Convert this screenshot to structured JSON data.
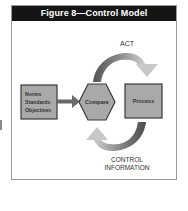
{
  "figure": {
    "title": "Figure 8—Control Model",
    "header_bg": "#151515",
    "header_fg": "#ffffff"
  },
  "nodes": {
    "inputs": {
      "label_lines": [
        "Norms",
        "Standards",
        "Objectives"
      ],
      "line1": "Norms",
      "line2": "Standards",
      "line3": "Objectives",
      "fill": "#a9a9a9"
    },
    "compare": {
      "label": "Compare",
      "shape": "hexagon",
      "fill": "#a9a9a9"
    },
    "process": {
      "label": "Process",
      "shape": "rectangle",
      "fill": "#a9a9a9"
    }
  },
  "edges": [
    {
      "from": "inputs",
      "to": "compare",
      "label": ""
    },
    {
      "from": "compare",
      "to": "process",
      "label": "ACT",
      "style": "curved-top-arrow"
    },
    {
      "from": "process",
      "to": "compare",
      "label": "CONTROL INFORMATION",
      "style": "curved-bottom-arrow"
    }
  ],
  "labels": {
    "act": "ACT",
    "control_line1": "CONTROL",
    "control_line2": "INFORMATION"
  },
  "colors": {
    "arrow_dark": "#5a5a5a",
    "arrow_light": "#c4c4c4",
    "border": "#3a3a3a"
  }
}
